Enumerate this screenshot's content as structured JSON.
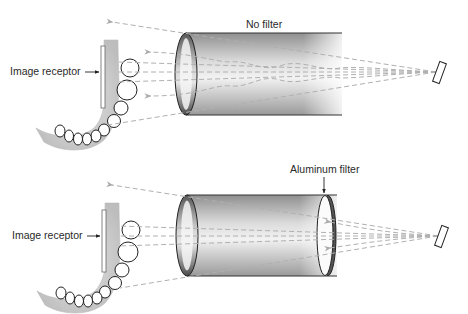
{
  "panels": [
    {
      "id": "top",
      "title": "No filter",
      "receptor_label": "Image receptor",
      "filter": false
    },
    {
      "id": "bottom",
      "title": "Aluminum filter",
      "receptor_label": "Image receptor",
      "filter": true
    }
  ],
  "colors": {
    "beam_line": "#b5b5b5",
    "outline": "#222222",
    "cylinder_dark": "#8a8a8a",
    "cylinder_light": "#f4f4f4",
    "jaw": "#c9c9c9",
    "tooth": "#ffffff"
  },
  "icons": {
    "source": "x-ray-source-rectangle",
    "receptor": "image-receptor-plate",
    "arrow": "pointer-arrow-icon"
  }
}
